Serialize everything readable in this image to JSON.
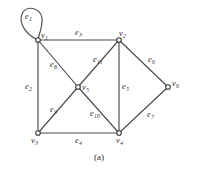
{
  "figure": {
    "caption": "(a)",
    "stroke_color": "#4a4a4a",
    "vertex_fill": "#ffffff",
    "background": "#ffffff",
    "vertices": [
      {
        "id": "v1",
        "base": "v",
        "sub": "1",
        "x": 38,
        "y": 40,
        "label_x": 41,
        "label_y": 31
      },
      {
        "id": "v2",
        "base": "v",
        "sub": "2",
        "x": 119,
        "y": 40,
        "label_x": 119,
        "label_y": 29
      },
      {
        "id": "v3",
        "base": "v",
        "sub": "3",
        "x": 38,
        "y": 133,
        "label_x": 31,
        "label_y": 136
      },
      {
        "id": "v4",
        "base": "v",
        "sub": "4",
        "x": 119,
        "y": 133,
        "label_x": 116,
        "label_y": 136
      },
      {
        "id": "v5",
        "base": "v",
        "sub": "5",
        "x": 78,
        "y": 87,
        "label_x": 82,
        "label_y": 83
      },
      {
        "id": "v6",
        "base": "v",
        "sub": "6",
        "x": 168,
        "y": 87,
        "label_x": 172,
        "label_y": 79
      }
    ],
    "edges": [
      {
        "id": "e1",
        "base": "e",
        "sub": "1",
        "from": "v1",
        "to": "v1",
        "kind": "loop",
        "label_x": 25,
        "label_y": 12
      },
      {
        "id": "e2",
        "base": "e",
        "sub": "2",
        "from": "v1",
        "to": "v3",
        "kind": "straight",
        "label_x": 25,
        "label_y": 82
      },
      {
        "id": "e3",
        "base": "e",
        "sub": "3",
        "from": "v1",
        "to": "v2",
        "kind": "straight",
        "label_x": 75,
        "label_y": 28
      },
      {
        "id": "e4",
        "base": "e",
        "sub": "4",
        "from": "v3",
        "to": "v4",
        "kind": "straight",
        "label_x": 75,
        "label_y": 136
      },
      {
        "id": "e5",
        "base": "e",
        "sub": "5",
        "from": "v2",
        "to": "v4",
        "kind": "straight",
        "label_x": 122,
        "label_y": 82
      },
      {
        "id": "e6",
        "base": "e",
        "sub": "6",
        "from": "v2",
        "to": "v6",
        "kind": "straight",
        "label_x": 148,
        "label_y": 55
      },
      {
        "id": "e7",
        "base": "e",
        "sub": "7",
        "from": "v4",
        "to": "v6",
        "kind": "straight",
        "label_x": 147,
        "label_y": 110
      },
      {
        "id": "e8",
        "base": "e",
        "sub": "8",
        "from": "v1",
        "to": "v5",
        "kind": "straight",
        "label_x": 50,
        "label_y": 60
      },
      {
        "id": "e9",
        "base": "e",
        "sub": "9",
        "from": "v3",
        "to": "v5",
        "kind": "straight",
        "label_x": 50,
        "label_y": 105
      },
      {
        "id": "e10",
        "base": "e",
        "sub": "10",
        "from": "v5",
        "to": "v4",
        "kind": "straight",
        "label_x": 90,
        "label_y": 109
      },
      {
        "id": "e11",
        "base": "e",
        "sub": "11",
        "from": "v2",
        "to": "v5",
        "kind": "straight",
        "label_x": 93,
        "label_y": 55
      }
    ],
    "loop_path": "M 38 40 C 27 35 18 24 22 14 C 26 5 40 7 42 18 C 43 28 38 36 38 40 Z"
  }
}
